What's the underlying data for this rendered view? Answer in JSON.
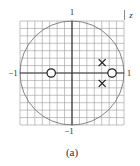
{
  "figure": {
    "type": "pole-zero plot",
    "plane_label": "z",
    "caption": "(a)",
    "axis_labels": {
      "top": "1",
      "bottom": "−1",
      "left": "−1",
      "right": "1"
    },
    "grid": {
      "cells_per_side": 14,
      "range": [
        -1,
        1
      ]
    },
    "unit_circle": true,
    "zeros": [
      {
        "re": -0.4,
        "im": 0
      },
      {
        "re": 0.77,
        "im": 0
      }
    ],
    "poles": [
      {
        "re": 0.58,
        "im": 0.2
      },
      {
        "re": 0.58,
        "im": -0.2
      }
    ],
    "colors": {
      "grid": "#9a9a9a",
      "axes": "#333333",
      "circle": "#777777",
      "markers": "#222222"
    }
  }
}
